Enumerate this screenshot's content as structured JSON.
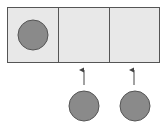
{
  "diagram": {
    "colors": {
      "cell_fill": "#e8e8e8",
      "cell_stroke": "#555555",
      "ball_fill": "#8a8a8a",
      "ball_stroke": "#555555",
      "arrow": "#444444",
      "background": "#ffffff"
    },
    "cells": [
      {
        "index": 0,
        "occupied": true
      },
      {
        "index": 1,
        "occupied": false
      },
      {
        "index": 2,
        "occupied": false
      }
    ],
    "incoming_balls": [
      {
        "target_cell": 1
      },
      {
        "target_cell": 2
      }
    ]
  }
}
